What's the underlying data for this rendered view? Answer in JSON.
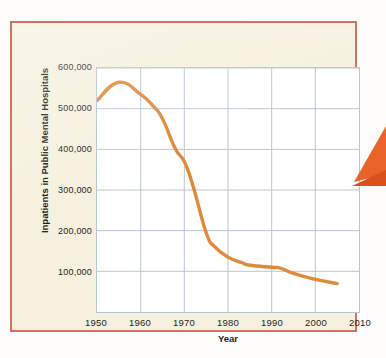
{
  "figure": {
    "panel_bg": "#f6f1de",
    "panel_border": "#cf7265",
    "plot_bg": "#ffffff",
    "grid_color": "#b9c4d2",
    "line_color": "#e08a3c",
    "accent_arrow_color": "#e8622a"
  },
  "chart_data": {
    "type": "line",
    "title": "",
    "xlabel": "Year",
    "ylabel": "Inpatients in Public Mental Hospitals",
    "xlim": [
      1950,
      2010
    ],
    "ylim": [
      0,
      600000
    ],
    "grid": true,
    "legend": "none",
    "xticks": [
      "1950",
      "1960",
      "1970",
      "1980",
      "1990",
      "2000",
      "2010"
    ],
    "xtick_values": [
      1950,
      1960,
      1970,
      1980,
      1990,
      2000,
      2010
    ],
    "yticks": [
      "100,000",
      "200,000",
      "300,000",
      "400,000",
      "500,000",
      "600,000"
    ],
    "ytick_values": [
      100000,
      200000,
      300000,
      400000,
      500000,
      600000
    ],
    "series": [
      {
        "name": "Inpatients in Public Mental Hospitals",
        "color": "#e08a3c",
        "x": [
          1950,
          1955,
          1960,
          1963,
          1965,
          1968,
          1970,
          1972,
          1975,
          1977,
          1980,
          1983,
          1985,
          1990,
          1992,
          1995,
          2000,
          2005
        ],
        "values": [
          520000,
          565000,
          535000,
          505000,
          475000,
          400000,
          370000,
          310000,
          195000,
          160000,
          135000,
          122000,
          115000,
          110000,
          108000,
          95000,
          80000,
          70000
        ]
      }
    ]
  }
}
